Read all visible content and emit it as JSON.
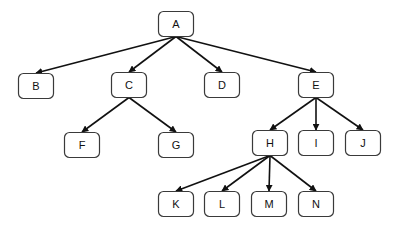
{
  "diagram": {
    "type": "tree",
    "node_size": {
      "w": 35,
      "h": 25,
      "rx": 5
    },
    "nodes": [
      {
        "id": "A",
        "label": "A",
        "cx": 176,
        "cy": 24
      },
      {
        "id": "B",
        "label": "B",
        "cx": 36,
        "cy": 86
      },
      {
        "id": "C",
        "label": "C",
        "cx": 129,
        "cy": 85
      },
      {
        "id": "D",
        "label": "D",
        "cx": 222,
        "cy": 85
      },
      {
        "id": "E",
        "label": "E",
        "cx": 316,
        "cy": 85
      },
      {
        "id": "F",
        "label": "F",
        "cx": 82,
        "cy": 145
      },
      {
        "id": "G",
        "label": "G",
        "cx": 176,
        "cy": 145
      },
      {
        "id": "H",
        "label": "H",
        "cx": 270,
        "cy": 143
      },
      {
        "id": "I",
        "label": "I",
        "cx": 316,
        "cy": 143
      },
      {
        "id": "J",
        "label": "J",
        "cx": 363,
        "cy": 143
      },
      {
        "id": "K",
        "label": "K",
        "cx": 176,
        "cy": 204
      },
      {
        "id": "L",
        "label": "L",
        "cx": 222,
        "cy": 204
      },
      {
        "id": "M",
        "label": "M",
        "cx": 269,
        "cy": 204
      },
      {
        "id": "N",
        "label": "N",
        "cx": 316,
        "cy": 204
      }
    ],
    "edges": [
      {
        "from": "A",
        "to": "B"
      },
      {
        "from": "A",
        "to": "C"
      },
      {
        "from": "A",
        "to": "D"
      },
      {
        "from": "A",
        "to": "E"
      },
      {
        "from": "C",
        "to": "F"
      },
      {
        "from": "C",
        "to": "G"
      },
      {
        "from": "E",
        "to": "H"
      },
      {
        "from": "E",
        "to": "I"
      },
      {
        "from": "E",
        "to": "J"
      },
      {
        "from": "H",
        "to": "K"
      },
      {
        "from": "H",
        "to": "L"
      },
      {
        "from": "H",
        "to": "M"
      },
      {
        "from": "H",
        "to": "N"
      }
    ],
    "colors": {
      "stroke": "#111111",
      "node_border": "#3a3a3a",
      "background": "#ffffff"
    }
  }
}
